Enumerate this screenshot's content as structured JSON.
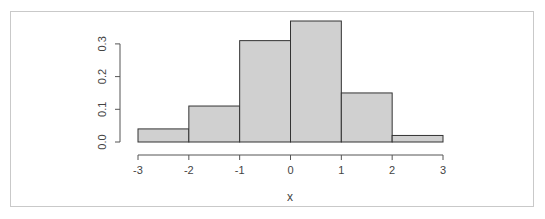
{
  "chart_data": {
    "type": "bar",
    "subtype": "histogram",
    "title": "",
    "xlabel": "x",
    "ylabel": "",
    "bins": [
      [
        -3,
        -2
      ],
      [
        -2,
        -1
      ],
      [
        -1,
        0
      ],
      [
        0,
        1
      ],
      [
        1,
        2
      ],
      [
        2,
        3
      ]
    ],
    "categories": [
      "-3 to -2",
      "-2 to -1",
      "-1 to 0",
      "0 to 1",
      "1 to 2",
      "2 to 3"
    ],
    "values": [
      0.04,
      0.11,
      0.31,
      0.37,
      0.15,
      0.02
    ],
    "xlim": [
      -3,
      3
    ],
    "ylim": [
      0,
      0.37
    ],
    "x_ticks": [
      "-3",
      "-2",
      "-1",
      "0",
      "1",
      "2",
      "3"
    ],
    "y_ticks": [
      "0.0",
      "0.1",
      "0.2",
      "0.3"
    ],
    "grid": false,
    "legend": null,
    "bar_color": "#d0d0d0",
    "edge_color": "#333333"
  }
}
